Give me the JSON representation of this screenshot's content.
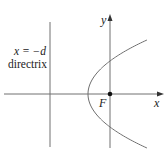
{
  "diagram": {
    "type": "parabola-focus-directrix",
    "labels": {
      "x_axis": "x",
      "y_axis": "y",
      "focus": "F",
      "directrix_equation": "x = −d",
      "directrix_name": "directrix"
    },
    "colors": {
      "axis": "#707070",
      "curve": "#707070",
      "focus_point": "#111111",
      "text": "#222222"
    }
  }
}
